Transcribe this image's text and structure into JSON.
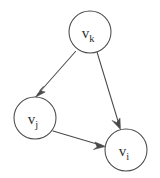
{
  "figure": {
    "type": "directed-graph",
    "background_color": "#ffffff",
    "ink_color": "#4a4a4a",
    "label_color": "#2e2e2e",
    "nodes": [
      {
        "id": "vk",
        "base": "v",
        "subscript": "k",
        "label": "v_k",
        "cx": 90,
        "cy": 32,
        "r": 21
      },
      {
        "id": "vj",
        "base": "v",
        "subscript": "j",
        "label": "v_j",
        "cx": 35,
        "cy": 118,
        "r": 21
      },
      {
        "id": "vi",
        "base": "v",
        "subscript": "i",
        "label": "v_i",
        "cx": 126,
        "cy": 150,
        "r": 21
      }
    ],
    "edges": [
      {
        "id": "vk-vj",
        "from": "vk",
        "to": "vj",
        "direction": "down-left",
        "arrowhead": true
      },
      {
        "id": "vk-vi",
        "from": "vk",
        "to": "vi",
        "direction": "down-right",
        "arrowhead": true
      },
      {
        "id": "vj-vi",
        "from": "vj",
        "to": "vi",
        "direction": "right-down",
        "arrowhead": true
      }
    ]
  }
}
